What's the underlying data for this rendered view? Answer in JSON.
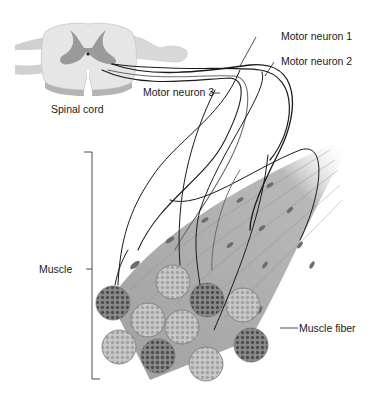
{
  "diagram": {
    "type": "anatomical illustration",
    "labels": {
      "spinal_cord": "Spinal cord",
      "motor_neuron_1": "Motor neuron 1",
      "motor_neuron_2": "Motor neuron 2",
      "motor_neuron_3": "Motor neuron 3",
      "muscle": "Muscle",
      "muscle_fiber": "Muscle fiber"
    },
    "colors": {
      "white_matter": "#e6e6e6",
      "gray_matter": "#9a9a9a",
      "fiber_body": "#a8a8a8",
      "fiber_dark_end": "#6e6e6e",
      "fiber_light_end": "#bcbcbc",
      "neuron_line": "#1a1a1a",
      "neuron_line_gray": "#6a6a6a"
    }
  }
}
